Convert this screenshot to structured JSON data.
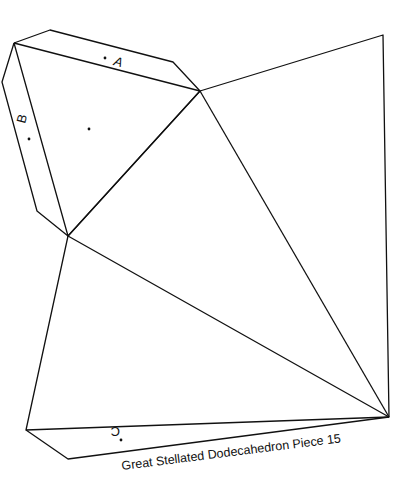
{
  "diagram": {
    "title": "Great Stellated Dodecahedron Piece 15",
    "flap_labels": {
      "a": "A",
      "b": "B",
      "c": "C"
    },
    "stroke_color": "#111111",
    "background": "#ffffff"
  }
}
